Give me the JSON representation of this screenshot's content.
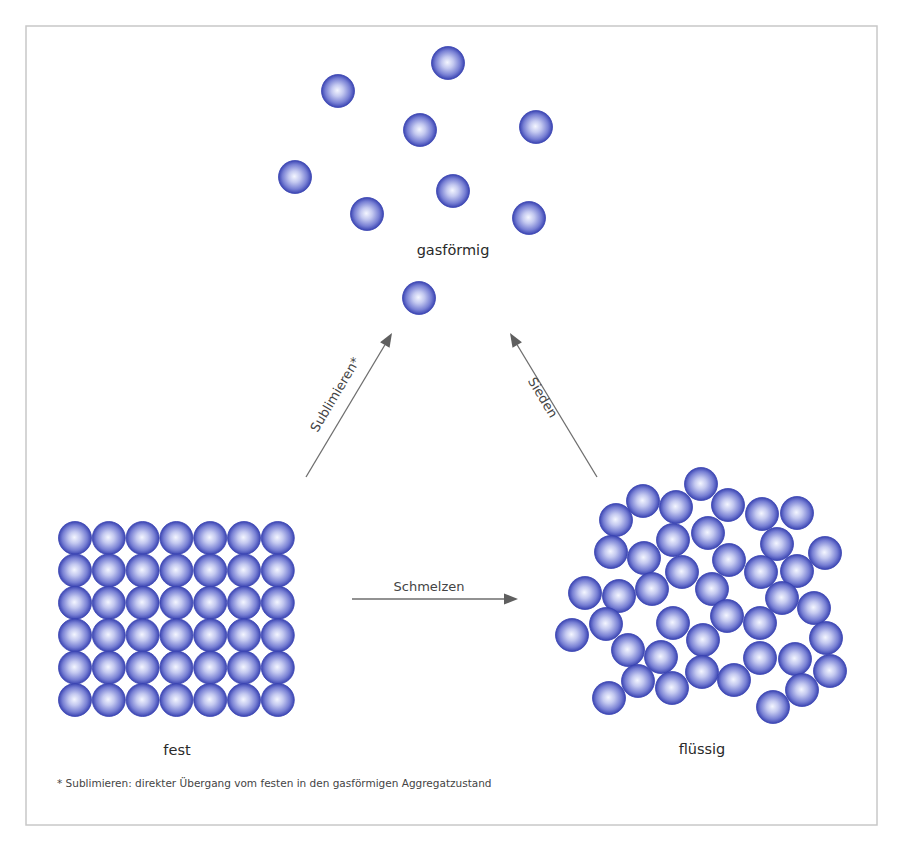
{
  "diagram": {
    "colors": {
      "particle_center": "#f4f6ff",
      "particle_mid": "#8a92dc",
      "particle_edge": "#3a44b2",
      "arrow": "#6e6e6e",
      "frame": "#c8c8c8"
    },
    "frame": {
      "x": 26,
      "y": 26,
      "w": 851,
      "h": 799
    },
    "particle_radius": 16.5,
    "states": {
      "gas": {
        "label": "gasförmig",
        "label_pos": [
          453,
          255
        ],
        "particles": [
          [
            448,
            63
          ],
          [
            338,
            91
          ],
          [
            420,
            130
          ],
          [
            536,
            127
          ],
          [
            295,
            177
          ],
          [
            453,
            191
          ],
          [
            367,
            214
          ],
          [
            529,
            218
          ],
          [
            419,
            298
          ]
        ]
      },
      "solid": {
        "label": "fest",
        "label_pos": [
          177,
          755
        ],
        "grid": {
          "cols": 7,
          "rows": 6,
          "origin": [
            75,
            538
          ],
          "dx": 33.8,
          "dy": 32.4
        }
      },
      "liquid": {
        "label": "flüssig",
        "label_pos": [
          702,
          754
        ],
        "particles": [
          [
            701,
            484
          ],
          [
            643,
            501
          ],
          [
            676,
            507
          ],
          [
            728,
            505
          ],
          [
            762,
            514
          ],
          [
            797,
            513
          ],
          [
            616,
            520
          ],
          [
            708,
            533
          ],
          [
            673,
            540
          ],
          [
            777,
            544
          ],
          [
            611,
            552
          ],
          [
            825,
            553
          ],
          [
            644,
            558
          ],
          [
            729,
            560
          ],
          [
            761,
            572
          ],
          [
            797,
            571
          ],
          [
            682,
            572
          ],
          [
            585,
            593
          ],
          [
            619,
            596
          ],
          [
            652,
            589
          ],
          [
            712,
            589
          ],
          [
            782,
            598
          ],
          [
            814,
            608
          ],
          [
            727,
            616
          ],
          [
            606,
            624
          ],
          [
            673,
            623
          ],
          [
            760,
            623
          ],
          [
            572,
            635
          ],
          [
            703,
            640
          ],
          [
            826,
            638
          ],
          [
            628,
            650
          ],
          [
            661,
            657
          ],
          [
            760,
            658
          ],
          [
            795,
            659
          ],
          [
            702,
            672
          ],
          [
            830,
            671
          ],
          [
            638,
            681
          ],
          [
            672,
            688
          ],
          [
            734,
            680
          ],
          [
            802,
            690
          ],
          [
            609,
            698
          ],
          [
            773,
            707
          ]
        ]
      }
    },
    "transitions": [
      {
        "id": "sublimieren",
        "label": "Sublimieren*",
        "from": [
          306,
          477
        ],
        "to": [
          392,
          333
        ],
        "label_pos": [
          336,
          395
        ],
        "angle": -59.2
      },
      {
        "id": "sieden",
        "label": "Sieden",
        "from": [
          597,
          477
        ],
        "to": [
          510,
          333
        ],
        "label_pos": [
          542,
          398
        ],
        "angle": 58.9
      },
      {
        "id": "schmelzen",
        "label": "Schmelzen",
        "from": [
          352,
          599
        ],
        "to": [
          518,
          599
        ],
        "label_pos": [
          429,
          587
        ],
        "angle": 0
      }
    ],
    "footnote": {
      "text": "* Sublimieren: direkter Übergang vom festen in den gasförmigen Aggregatzustand",
      "pos": [
        57,
        787
      ]
    }
  }
}
